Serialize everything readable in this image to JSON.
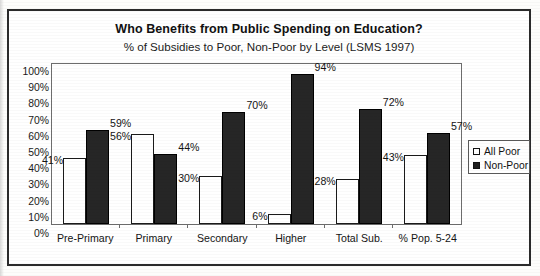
{
  "chart_data": {
    "type": "bar",
    "title": "Who Benefits from Public Spending on Education?",
    "subtitle": "% of Subsidies to Poor, Non-Poor by Level (LSMS 1997)",
    "xlabel": "",
    "ylabel": "",
    "ylim": [
      0,
      100
    ],
    "ytick_labels": [
      "100%",
      "90%",
      "80%",
      "70%",
      "60%",
      "50%",
      "40%",
      "30%",
      "20%",
      "10%",
      "0%"
    ],
    "grid": false,
    "legend_position": "right",
    "categories": [
      "Pre-Primary",
      "Primary",
      "Secondary",
      "Higher",
      "Total Sub.",
      "% Pop. 5-24"
    ],
    "series": [
      {
        "name": "All Poor",
        "color": "#ffffff",
        "values": [
          41,
          56,
          30,
          6,
          28,
          43
        ],
        "labels": [
          "41%",
          "56%",
          "30%",
          "6%",
          "28%",
          "43%"
        ]
      },
      {
        "name": "Non-Poor",
        "color": "#262626",
        "values": [
          59,
          44,
          70,
          94,
          72,
          57
        ],
        "labels": [
          "59%",
          "44%",
          "70%",
          "94%",
          "72%",
          "57%"
        ]
      }
    ]
  },
  "legend": {
    "items": [
      {
        "label": "All Poor",
        "swatch": "white-square-icon"
      },
      {
        "label": "Non-Poor",
        "swatch": "black-square-icon"
      }
    ]
  }
}
